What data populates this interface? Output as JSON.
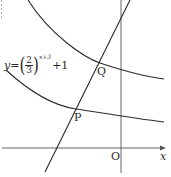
{
  "diagram": {
    "type": "function-graph",
    "axes": {
      "x_label": "x",
      "origin_label": "O"
    },
    "equation_label": {
      "lhs": "y",
      "equals": "=",
      "base_numerator": "2",
      "base_denominator": "3",
      "exponent": "x+3",
      "tail": "+1"
    },
    "points": [
      {
        "label": "Q",
        "description": "intersection of line with upper curve"
      },
      {
        "label": "P",
        "description": "intersection of line with lower curve y=(2/3)^(x+3)+1"
      }
    ],
    "curves": [
      {
        "name": "upper-exponential-curve"
      },
      {
        "name": "lower-exponential-curve",
        "equation": "y=(2/3)^(x+3)+1"
      },
      {
        "name": "straight-line"
      }
    ],
    "colors": {
      "stroke": "#2a2a2a",
      "axis": "#555555",
      "background": "#ffffff"
    }
  }
}
